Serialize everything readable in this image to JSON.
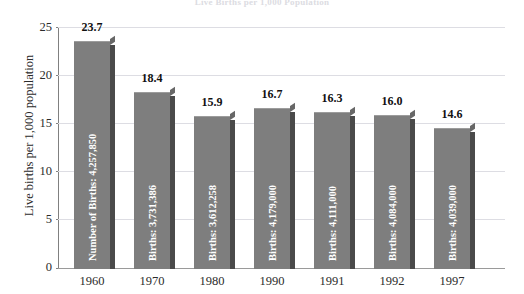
{
  "chart_data": {
    "type": "bar",
    "title": "Live Births per 1,000 Population",
    "xlabel": "",
    "ylabel": "Live births per 1,000 population",
    "ylim": [
      0,
      25
    ],
    "yticks": [
      "0",
      "5",
      "10",
      "15",
      "20",
      "25"
    ],
    "grid": true,
    "legend": "none",
    "categories": [
      "1960",
      "1970",
      "1980",
      "1990",
      "1991",
      "1992",
      "1997"
    ],
    "values": [
      23.7,
      18.4,
      15.9,
      16.7,
      16.3,
      16.0,
      14.6
    ],
    "value_labels": [
      "23.7",
      "18.4",
      "15.9",
      "16.7",
      "16.3",
      "16.0",
      "14.6"
    ],
    "bar_annotations": [
      "Number of Births: 4,257,850",
      "Births: 3,731,386",
      "Births: 3,612,258",
      "Births: 4,179,000",
      "Births: 4,111,000",
      "Births: 4,084,000",
      "Births: 4,039,000"
    ],
    "births_counts": [
      4257850,
      3731386,
      3612258,
      4179000,
      4111000,
      4084000,
      4039000
    ],
    "colors": {
      "bar_face": "#7e7e7e",
      "bar_side": "#4a4a4a",
      "bar_top": "#676767",
      "gridline": "#dddde3",
      "axis": "#808080",
      "text": "#2b2b2b",
      "value_label": "#111111",
      "bar_label": "#ffffff",
      "background": "#ffffff"
    }
  }
}
